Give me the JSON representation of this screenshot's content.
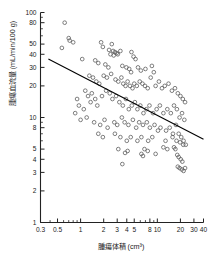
{
  "chart": {
    "title": "",
    "xlabel": "腫瘍体積 (cm³)",
    "ylabel": "腫瘍血流量 (mL/min/100 g)"
  },
  "chart_data": {
    "type": "scatter",
    "title": "",
    "xlabel": "腫瘍体積 (cm³)",
    "ylabel": "腫瘍血流量 (mL/min/100 g)",
    "xscale": "log",
    "yscale": "log",
    "xlim": [
      0.3,
      40
    ],
    "ylim": [
      1,
      100
    ],
    "grid": false,
    "legend": null,
    "xticks": [
      0.3,
      0.5,
      1,
      2,
      3,
      4,
      5,
      8,
      10,
      20,
      30,
      40
    ],
    "xticklabels": [
      "0.3",
      "0.5",
      "1",
      "2",
      "3",
      "4",
      "5",
      "8",
      "10",
      "20",
      "30",
      "40"
    ],
    "yticks": [
      1,
      2,
      3,
      4,
      5,
      8,
      10,
      20,
      30,
      40,
      50,
      80,
      100
    ],
    "yticklabels": [
      "1",
      "2",
      "3",
      "4",
      "5",
      "8",
      "10",
      "20",
      "30",
      "40",
      "50",
      "80",
      "100"
    ],
    "series": [
      {
        "name": "腫瘍",
        "marker": "open-circle",
        "color": "#555555",
        "points": [
          [
            0.62,
            80
          ],
          [
            0.7,
            57
          ],
          [
            0.72,
            54
          ],
          [
            0.8,
            52
          ],
          [
            0.57,
            46
          ],
          [
            1.85,
            52
          ],
          [
            1.95,
            47
          ],
          [
            2.55,
            50
          ],
          [
            2.35,
            44
          ],
          [
            2.65,
            43
          ],
          [
            2.8,
            42
          ],
          [
            2.95,
            41
          ],
          [
            2.45,
            40
          ],
          [
            2.7,
            39
          ],
          [
            3.05,
            40
          ],
          [
            3.3,
            43
          ],
          [
            4.6,
            42
          ],
          [
            4.9,
            38
          ],
          [
            5.2,
            36
          ],
          [
            1.55,
            35
          ],
          [
            1.7,
            33
          ],
          [
            1.05,
            36
          ],
          [
            2.1,
            32
          ],
          [
            2.3,
            30
          ],
          [
            3.5,
            31
          ],
          [
            3.95,
            30
          ],
          [
            4.3,
            29
          ],
          [
            4.55,
            27
          ],
          [
            5.6,
            30
          ],
          [
            6.1,
            28
          ],
          [
            7.0,
            29
          ],
          [
            8.5,
            31
          ],
          [
            9.0,
            27
          ],
          [
            1.3,
            25
          ],
          [
            1.45,
            24
          ],
          [
            1.6,
            22
          ],
          [
            1.75,
            21
          ],
          [
            2.0,
            25
          ],
          [
            2.2,
            24
          ],
          [
            2.5,
            26
          ],
          [
            2.85,
            23
          ],
          [
            3.1,
            22
          ],
          [
            3.4,
            24
          ],
          [
            3.6,
            21
          ],
          [
            3.85,
            20
          ],
          [
            4.1,
            22
          ],
          [
            4.4,
            20
          ],
          [
            4.75,
            19
          ],
          [
            5.0,
            21
          ],
          [
            5.4,
            20
          ],
          [
            5.9,
            22
          ],
          [
            6.4,
            21
          ],
          [
            6.9,
            20
          ],
          [
            7.5,
            19
          ],
          [
            8.2,
            24
          ],
          [
            9.5,
            20
          ],
          [
            10.5,
            22
          ],
          [
            11.5,
            19
          ],
          [
            12.5,
            20
          ],
          [
            14.0,
            21
          ],
          [
            15.5,
            18
          ],
          [
            17.0,
            19
          ],
          [
            18.5,
            17
          ],
          [
            20.0,
            16
          ],
          [
            21.5,
            15
          ],
          [
            23.0,
            14
          ],
          [
            1.15,
            18
          ],
          [
            1.25,
            16
          ],
          [
            1.4,
            17
          ],
          [
            1.55,
            15
          ],
          [
            0.9,
            15
          ],
          [
            0.95,
            13
          ],
          [
            1.1,
            12
          ],
          [
            1.35,
            14
          ],
          [
            1.65,
            13
          ],
          [
            1.9,
            16
          ],
          [
            2.15,
            18
          ],
          [
            2.4,
            17
          ],
          [
            2.6,
            15
          ],
          [
            2.9,
            16
          ],
          [
            3.2,
            14
          ],
          [
            3.55,
            13
          ],
          [
            3.9,
            15
          ],
          [
            4.25,
            12
          ],
          [
            4.65,
            13
          ],
          [
            5.1,
            14
          ],
          [
            5.5,
            12
          ],
          [
            6.0,
            13
          ],
          [
            6.6,
            11
          ],
          [
            7.2,
            12
          ],
          [
            7.9,
            13
          ],
          [
            8.8,
            11
          ],
          [
            9.8,
            12
          ],
          [
            10.8,
            13
          ],
          [
            12.0,
            11
          ],
          [
            13.5,
            12
          ],
          [
            15.0,
            11
          ],
          [
            16.5,
            13
          ],
          [
            18.0,
            12
          ],
          [
            19.5,
            10
          ],
          [
            21.0,
            11
          ],
          [
            22.5,
            9.5
          ],
          [
            0.85,
            11
          ],
          [
            1.0,
            9.5
          ],
          [
            1.2,
            10
          ],
          [
            1.5,
            9
          ],
          [
            1.8,
            8.5
          ],
          [
            2.05,
            9.5
          ],
          [
            2.25,
            8
          ],
          [
            2.75,
            9
          ],
          [
            3.0,
            8.5
          ],
          [
            3.45,
            10
          ],
          [
            3.75,
            9
          ],
          [
            4.2,
            8.5
          ],
          [
            4.8,
            9.5
          ],
          [
            5.3,
            8
          ],
          [
            5.8,
            9
          ],
          [
            6.5,
            8.5
          ],
          [
            7.3,
            9
          ],
          [
            8.0,
            8
          ],
          [
            9.2,
            8.5
          ],
          [
            10.2,
            7.5
          ],
          [
            11.0,
            8
          ],
          [
            13.0,
            7.5
          ],
          [
            14.5,
            8
          ],
          [
            16.0,
            7
          ],
          [
            17.5,
            8.5
          ],
          [
            19.0,
            7
          ],
          [
            20.5,
            6.5
          ],
          [
            22.0,
            6
          ],
          [
            1.7,
            7
          ],
          [
            1.95,
            6.5
          ],
          [
            2.8,
            7
          ],
          [
            3.3,
            6.5
          ],
          [
            4.0,
            6
          ],
          [
            4.5,
            6.5
          ],
          [
            5.5,
            6
          ],
          [
            6.2,
            6.5
          ],
          [
            7.6,
            6
          ],
          [
            8.6,
            6.5
          ],
          [
            12.8,
            6
          ],
          [
            15.8,
            6.5
          ],
          [
            17.8,
            6
          ],
          [
            19.8,
            5.8
          ],
          [
            21.8,
            5.5
          ],
          [
            23.5,
            5.5
          ],
          [
            3.1,
            5
          ],
          [
            3.8,
            4.6
          ],
          [
            4.1,
            4.8
          ],
          [
            6.8,
            5
          ],
          [
            7.5,
            4.8
          ],
          [
            9.5,
            4.5
          ],
          [
            18.2,
            4.4
          ],
          [
            19.0,
            4.2
          ],
          [
            20.2,
            4.0
          ],
          [
            21.2,
            3.8
          ],
          [
            3.5,
            3.6
          ],
          [
            18.5,
            3.4
          ],
          [
            19.5,
            3.3
          ],
          [
            20.8,
            3.2
          ],
          [
            22.0,
            3.1
          ],
          [
            23.0,
            3.3
          ],
          [
            6.2,
            4.5
          ],
          [
            6.5,
            4.3
          ],
          [
            12.0,
            5.2
          ],
          [
            13.5,
            5.0
          ],
          [
            16.5,
            5.2
          ],
          [
            17.2,
            5.0
          ]
        ]
      }
    ],
    "regression_line": {
      "name": "回帰直線",
      "color": "#000000",
      "x_start": 0.38,
      "y_start": 36,
      "x_end": 40,
      "y_end": 6.2
    }
  }
}
